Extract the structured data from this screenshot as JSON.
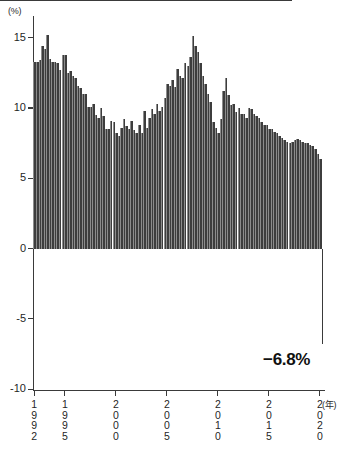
{
  "chart_data": {
    "type": "bar",
    "title": "",
    "xlabel": "(年)",
    "ylabel": "(%)",
    "ylim": [
      -10,
      17
    ],
    "xlim": [
      1992,
      2020.5
    ],
    "grid": false,
    "legend": null,
    "y_ticks": [
      {
        "value": 15,
        "label": "15"
      },
      {
        "value": 10,
        "label": "10"
      },
      {
        "value": 5,
        "label": "5"
      },
      {
        "value": 0,
        "label": "0"
      },
      {
        "value": -5,
        "label": "-5"
      },
      {
        "value": -10,
        "label": "-10"
      }
    ],
    "x_ticks": [
      {
        "value": 1992,
        "label": "1\n9\n9\n2"
      },
      {
        "value": 1995,
        "label": "1\n9\n9\n5"
      },
      {
        "value": 2000,
        "label": "2\n0\n0\n0"
      },
      {
        "value": 2005,
        "label": "2\n0\n0\n5"
      },
      {
        "value": 2010,
        "label": "2\n0\n1\n0"
      },
      {
        "value": 2015,
        "label": "2\n0\n1\n5"
      },
      {
        "value": 2020,
        "label": "2\n0\n2\n0"
      }
    ],
    "annotations": [
      {
        "name": "final-value",
        "text": "−6.8%",
        "x": 2020.25,
        "y": -6.8
      }
    ],
    "x": [
      1992.0,
      1992.25,
      1992.5,
      1992.75,
      1993.0,
      1993.25,
      1993.5,
      1993.75,
      1994.0,
      1994.25,
      1994.5,
      1994.75,
      1995.0,
      1995.25,
      1995.5,
      1995.75,
      1996.0,
      1996.25,
      1996.5,
      1996.75,
      1997.0,
      1997.25,
      1997.5,
      1997.75,
      1998.0,
      1998.25,
      1998.5,
      1998.75,
      1999.0,
      1999.25,
      1999.5,
      1999.75,
      2000.0,
      2000.25,
      2000.5,
      2000.75,
      2001.0,
      2001.25,
      2001.5,
      2001.75,
      2002.0,
      2002.25,
      2002.5,
      2002.75,
      2003.0,
      2003.25,
      2003.5,
      2003.75,
      2004.0,
      2004.25,
      2004.5,
      2004.75,
      2005.0,
      2005.25,
      2005.5,
      2005.75,
      2006.0,
      2006.25,
      2006.5,
      2006.75,
      2007.0,
      2007.25,
      2007.5,
      2007.75,
      2008.0,
      2008.25,
      2008.5,
      2008.75,
      2009.0,
      2009.25,
      2009.5,
      2009.75,
      2010.0,
      2010.25,
      2010.5,
      2010.75,
      2011.0,
      2011.25,
      2011.5,
      2011.75,
      2012.0,
      2012.25,
      2012.5,
      2012.75,
      2013.0,
      2013.25,
      2013.5,
      2013.75,
      2014.0,
      2014.25,
      2014.5,
      2014.75,
      2015.0,
      2015.25,
      2015.5,
      2015.75,
      2016.0,
      2016.25,
      2016.5,
      2016.75,
      2017.0,
      2017.25,
      2017.5,
      2017.75,
      2018.0,
      2018.25,
      2018.5,
      2018.75,
      2019.0,
      2019.25,
      2019.5,
      2019.75,
      2020.0,
      2020.25
    ],
    "values": [
      13.3,
      13.3,
      13.4,
      14.4,
      14.2,
      15.2,
      13.5,
      13.3,
      13.3,
      13.2,
      12.7,
      13.8,
      13.8,
      12.5,
      12.6,
      12.3,
      12.1,
      11.6,
      11.4,
      11.0,
      11.0,
      10.1,
      10.1,
      10.3,
      9.5,
      9.3,
      10.0,
      9.4,
      8.5,
      8.5,
      9.1,
      9.0,
      8.2,
      8.0,
      8.6,
      9.2,
      8.7,
      8.5,
      9.1,
      8.4,
      8.2,
      8.8,
      8.2,
      9.8,
      8.6,
      9.3,
      9.9,
      9.6,
      10.3,
      9.8,
      10.1,
      10.7,
      11.7,
      11.6,
      12.0,
      11.5,
      12.8,
      12.3,
      12.1,
      13.2,
      13.0,
      13.6,
      15.1,
      14.4,
      14.0,
      13.2,
      12.3,
      11.7,
      11.0,
      10.4,
      9.0,
      8.6,
      8.2,
      9.2,
      11.2,
      12.1,
      10.9,
      10.2,
      10.3,
      9.7,
      10.0,
      9.6,
      9.6,
      9.3,
      10.0,
      9.9,
      9.6,
      9.4,
      9.3,
      9.0,
      8.8,
      8.8,
      8.5,
      8.5,
      8.3,
      8.2,
      8.0,
      7.9,
      7.7,
      7.6,
      7.5,
      7.6,
      7.7,
      7.8,
      7.7,
      7.6,
      7.5,
      7.5,
      7.4,
      7.3,
      7.1,
      6.7,
      6.4,
      -6.8
    ]
  }
}
